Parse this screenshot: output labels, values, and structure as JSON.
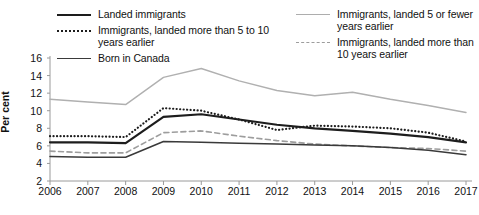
{
  "chart_data": {
    "type": "line",
    "title": "",
    "xlabel": "",
    "ylabel": "Per cent",
    "x": [
      2006,
      2007,
      2008,
      2009,
      2010,
      2011,
      2012,
      2013,
      2014,
      2015,
      2016,
      2017
    ],
    "xtick_labels": [
      "2006",
      "2007",
      "2008",
      "2009",
      "2010",
      "2011",
      "2012",
      "2013",
      "2014",
      "2015",
      "2016",
      "2017"
    ],
    "ytick_labels": [
      "16",
      "14",
      "12",
      "10",
      "8",
      "6",
      "4",
      "2"
    ],
    "yticks": [
      16,
      14,
      12,
      10,
      8,
      6,
      4,
      2
    ],
    "ylim": [
      2,
      16
    ],
    "xlim": [
      2006,
      2017
    ],
    "grid": false,
    "legend_position": "top",
    "series": [
      {
        "name": "Landed immigrants",
        "style": "solid",
        "color": "#1d1d1d",
        "width": 2.2,
        "values": [
          6.4,
          6.4,
          6.3,
          9.3,
          9.6,
          9.0,
          8.4,
          8.0,
          7.7,
          7.4,
          7.0,
          6.4
        ]
      },
      {
        "name": "Immigrants, landed more than 5 to 10 years earlier",
        "style": "dotted",
        "color": "#1d1d1d",
        "width": 2.2,
        "values": [
          7.1,
          7.1,
          7.0,
          10.3,
          10.0,
          9.0,
          7.8,
          8.3,
          8.2,
          8.0,
          7.5,
          6.5
        ]
      },
      {
        "name": "Born in Canada",
        "style": "solid",
        "color": "#3a3a3a",
        "width": 1.5,
        "values": [
          4.8,
          4.7,
          4.7,
          6.5,
          6.4,
          6.3,
          6.2,
          6.1,
          6.0,
          5.8,
          5.5,
          5.0
        ]
      },
      {
        "name": "Immigrants, landed 5 or fewer years earlier",
        "style": "solid",
        "color": "#b0b0b0",
        "width": 1.4,
        "values": [
          11.3,
          11.0,
          10.7,
          13.8,
          14.8,
          13.4,
          12.3,
          11.7,
          12.1,
          11.3,
          10.6,
          9.8
        ]
      },
      {
        "name": "Immigrants, landed more than 10 years earlier",
        "style": "dashed",
        "color": "#9d9d9d",
        "width": 1.6,
        "values": [
          5.4,
          5.2,
          5.2,
          7.5,
          7.7,
          7.1,
          6.6,
          6.2,
          6.0,
          5.8,
          5.7,
          5.4
        ]
      }
    ]
  },
  "legend": {
    "left_column": [
      {
        "label": "Landed immigrants",
        "swatch": "sw-solid-black"
      },
      {
        "label": "Immigrants, landed more than 5 to 10 years earlier",
        "swatch": "sw-dotted-black"
      },
      {
        "label": "Born in Canada",
        "swatch": "sw-solid-dark"
      }
    ],
    "right_column": [
      {
        "label": "Immigrants, landed 5 or fewer years earlier",
        "swatch": "sw-solid-gray"
      },
      {
        "label": "Immigrants, landed more than 10 years earlier",
        "swatch": "sw-dashed-gray"
      }
    ]
  },
  "axes": {
    "y_axis_title": "Per cent"
  }
}
